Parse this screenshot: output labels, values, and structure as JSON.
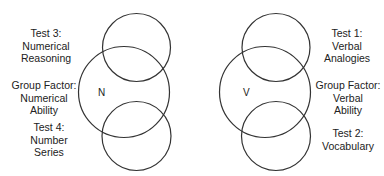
{
  "diagram": {
    "left_group": {
      "factor_letter": "N",
      "top_test": {
        "lines": [
          "Test 3:",
          "Numerical",
          "Reasoning"
        ]
      },
      "group_factor": {
        "lines": [
          "Group Factor:",
          "Numerical",
          "Ability"
        ]
      },
      "bottom_test": {
        "lines": [
          "Test 4:",
          "Number",
          "Series"
        ]
      }
    },
    "right_group": {
      "factor_letter": "V",
      "top_test": {
        "lines": [
          "Test 1:",
          "Verbal",
          "Analogies"
        ]
      },
      "group_factor": {
        "lines": [
          "Group Factor:",
          "Verbal",
          "Ability"
        ]
      },
      "bottom_test": {
        "lines": [
          "Test 2:",
          "Vocabulary"
        ]
      }
    },
    "stroke_color": "#333333",
    "background": "#ffffff"
  }
}
